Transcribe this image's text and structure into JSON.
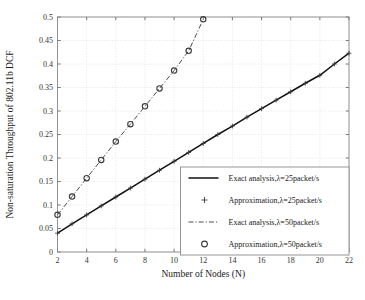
{
  "chart_data": {
    "type": "line",
    "title": "",
    "xlabel": "Number of Nodes (N)",
    "ylabel": "Non-saturation Throughput of 802.11b DCF",
    "xlim": [
      2,
      22
    ],
    "ylim": [
      0,
      0.5
    ],
    "xticks": [
      2,
      4,
      6,
      8,
      10,
      12,
      14,
      16,
      18,
      20,
      22
    ],
    "xtick_labels": [
      "2",
      "4",
      "6",
      "8",
      "10",
      "12",
      "14",
      "16",
      "18",
      "20",
      "22"
    ],
    "yticks": [
      0,
      0.05,
      0.1,
      0.15,
      0.2,
      0.25,
      0.3,
      0.35,
      0.4,
      0.45,
      0.5
    ],
    "ytick_labels": [
      "0",
      "0.05",
      "0.1",
      "0.15",
      "0.2",
      "0.25",
      "0.3",
      "0.35",
      "0.4",
      "0.45",
      "0.5"
    ],
    "grid": true,
    "legend_position": "lower right",
    "series": [
      {
        "name": "Exact analysis,λ=25packet/s",
        "style": "solid-line",
        "marker": "none",
        "color": "#111111",
        "x": [
          2,
          3,
          4,
          5,
          6,
          7,
          8,
          9,
          10,
          11,
          12,
          13,
          14,
          15,
          16,
          17,
          18,
          19,
          20,
          21,
          22
        ],
        "values": [
          0.04,
          0.06,
          0.079,
          0.098,
          0.117,
          0.136,
          0.155,
          0.174,
          0.193,
          0.212,
          0.231,
          0.25,
          0.268,
          0.287,
          0.305,
          0.323,
          0.341,
          0.359,
          0.376,
          0.4,
          0.423
        ]
      },
      {
        "name": "Approximation,λ=25packet/s",
        "style": "markers",
        "marker": "plus",
        "color": "#3b3b3b",
        "x": [
          2,
          3,
          4,
          5,
          6,
          7,
          8,
          9,
          10,
          11,
          12,
          13,
          14,
          15,
          16,
          17,
          18,
          19,
          20,
          21,
          22
        ],
        "values": [
          0.04,
          0.06,
          0.079,
          0.098,
          0.117,
          0.136,
          0.155,
          0.174,
          0.193,
          0.212,
          0.231,
          0.25,
          0.268,
          0.287,
          0.305,
          0.323,
          0.341,
          0.359,
          0.376,
          0.4,
          0.423
        ]
      },
      {
        "name": "Exact analysis,λ=50packet/s",
        "style": "dash-dot-line",
        "marker": "none",
        "color": "#4d4d4d",
        "x": [
          2,
          3,
          4,
          5,
          6,
          7,
          8,
          9,
          10,
          11,
          12
        ],
        "values": [
          0.079,
          0.118,
          0.157,
          0.196,
          0.235,
          0.272,
          0.31,
          0.348,
          0.386,
          0.428,
          0.495
        ]
      },
      {
        "name": "Approximation,λ=50packet/s",
        "style": "markers",
        "marker": "circle",
        "color": "#3b3b3b",
        "x": [
          2,
          3,
          4,
          5,
          6,
          7,
          8,
          9,
          10,
          11,
          12
        ],
        "values": [
          0.079,
          0.118,
          0.157,
          0.196,
          0.235,
          0.272,
          0.31,
          0.348,
          0.386,
          0.428,
          0.495
        ]
      }
    ]
  },
  "legend": {
    "entries": [
      {
        "label": "Exact analysis,λ=25packet/s",
        "sample": "solid-line"
      },
      {
        "label": "Approximation,λ=25packet/s",
        "sample": "plus-marker"
      },
      {
        "label": "Exact analysis,λ=50packet/s",
        "sample": "dash-dot-line"
      },
      {
        "label": "Approximation,λ=50packet/s",
        "sample": "circle-marker"
      }
    ]
  },
  "colors": {
    "series_25_exact": "#111111",
    "series_25_approx": "#3b3b3b",
    "series_50_exact": "#4d4d4d",
    "series_50_approx": "#3b3b3b",
    "grid": "#cfcfcf",
    "frame": "#888888",
    "background": "#ffffff"
  }
}
